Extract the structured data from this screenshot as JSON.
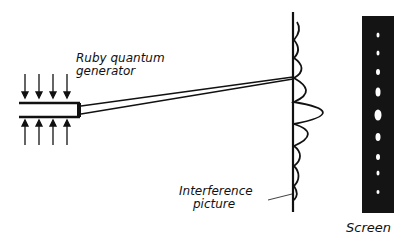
{
  "labels": {
    "generator": [
      "Ruby quantum",
      "generator"
    ],
    "interference": [
      "Interference",
      "picture"
    ],
    "screen": "Screen"
  },
  "colors": {
    "ink": "#111111",
    "background": "#ffffff",
    "screen_fill": "#141414",
    "spot": "#ffffff"
  }
}
